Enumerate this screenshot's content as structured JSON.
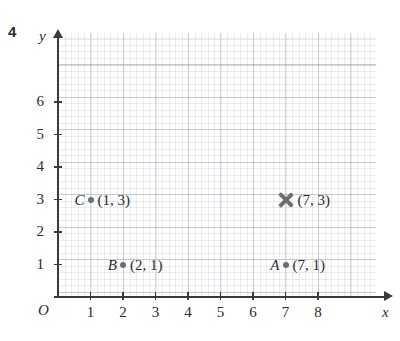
{
  "question_number": "4",
  "axes": {
    "x_label": "x",
    "y_label": "y",
    "origin_label": "O",
    "x_ticks": [
      "1",
      "2",
      "3",
      "4",
      "5",
      "6",
      "7",
      "8"
    ],
    "y_ticks": [
      "1",
      "2",
      "3",
      "4",
      "5",
      "6"
    ]
  },
  "chart_data": {
    "type": "scatter",
    "title": "",
    "xlabel": "x",
    "ylabel": "y",
    "xlim": [
      0,
      8.8
    ],
    "ylim": [
      0,
      7
    ],
    "xticks": [
      1,
      2,
      3,
      4,
      5,
      6,
      7,
      8
    ],
    "yticks": [
      1,
      2,
      3,
      4,
      5,
      6
    ],
    "grid": true,
    "minor_grid": true,
    "minor_per_unit": 5,
    "legend": "none",
    "origin_label": "O",
    "points": [
      {
        "name": "C",
        "x": 1,
        "y": 3,
        "marker": "dot",
        "coord_label": "(1, 3)"
      },
      {
        "name": "B",
        "x": 2,
        "y": 1,
        "marker": "dot",
        "coord_label": "(2, 1)"
      },
      {
        "name": "A",
        "x": 7,
        "y": 1,
        "marker": "dot",
        "coord_label": "(7, 1)"
      },
      {
        "name": "",
        "x": 7,
        "y": 3,
        "marker": "cross",
        "coord_label": "(7, 3)"
      }
    ]
  },
  "colors": {
    "marker": "#6e6e6e",
    "axis": "#3a3a3a",
    "text": "#2b2b2b",
    "grid_major": "#8c96af",
    "grid_minor": "#969eb4"
  }
}
